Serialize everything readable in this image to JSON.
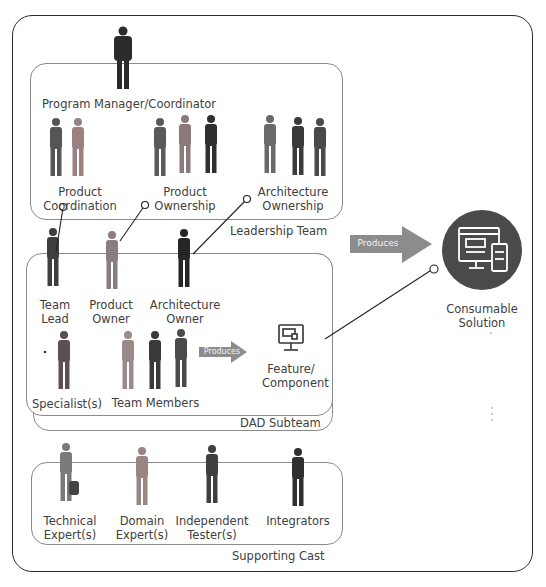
{
  "diagram": {
    "leadership_team": {
      "title": "Leadership Team",
      "program_manager": "Program Manager/Coordinator",
      "roles": [
        {
          "line1": "Product",
          "line2": "Coordination"
        },
        {
          "line1": "Product",
          "line2": "Ownership"
        },
        {
          "line1": "Architecture",
          "line2": "Ownership"
        }
      ]
    },
    "dad_subteam": {
      "title": "DAD Subteam",
      "roles": [
        {
          "line1": "Team",
          "line2": "Lead"
        },
        {
          "line1": "Product",
          "line2": "Owner"
        },
        {
          "line1": "Architecture",
          "line2": "Owner"
        }
      ],
      "specialists": "Specialist(s)",
      "team_members": "Team Members",
      "produces_label": "Produces",
      "output": {
        "line1": "Feature/",
        "line2": "Component"
      }
    },
    "produces_label": "Produces",
    "consumable_solution": {
      "line1": "Consumable",
      "line2": "Solution"
    },
    "supporting_cast": {
      "title": "Supporting Cast",
      "roles": [
        {
          "line1": "Technical",
          "line2": "Expert(s)"
        },
        {
          "line1": "Domain",
          "line2": "Expert(s)"
        },
        {
          "line1": "Independent",
          "line2": "Tester(s)"
        },
        {
          "line1": "Integrators",
          "line2": ""
        }
      ]
    },
    "colors": {
      "outer_border": "#2d2d2d",
      "group_border": "#8a8a8a",
      "arrow_fill": "#8c8c8c",
      "solution_circle": "#4a4a4a"
    }
  }
}
